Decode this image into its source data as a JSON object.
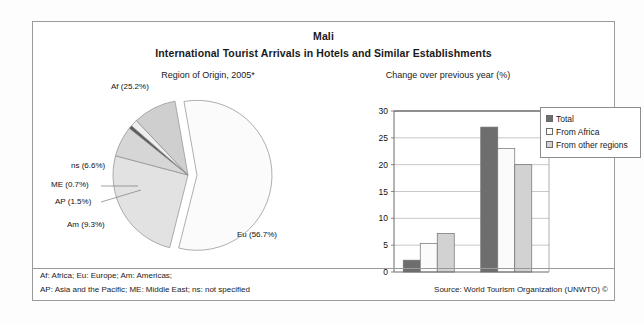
{
  "header": {
    "country": "Mali",
    "title": "International Tourist Arrivals in Hotels and Similar Establishments",
    "left_subtitle": "Region of Origin, 2005*",
    "right_subtitle": "Change over previous year (%)"
  },
  "legend": {
    "items": [
      {
        "label": "Total",
        "color": "#6e6e6e"
      },
      {
        "label": "From Africa",
        "color": "#fbfbfb"
      },
      {
        "label": "From other regions",
        "color": "#d2d2d2"
      }
    ]
  },
  "footer": {
    "note_line1": "Af: Africa; Eu: Europe; Am: Americas;",
    "note_line2": "AP: Asia and the Pacific; ME: Middle East; ns: not specified",
    "source": "Source: World Tourism Organization (UNWTO) ©"
  },
  "chart_data": [
    {
      "type": "pie",
      "title": "Region of Origin, 2005*",
      "unit": "%",
      "labels": [
        "Eu (56.7%)",
        "Af (25.2%)",
        "Am (9.3%)",
        "ns (6.6%)",
        "AP (1.5%)",
        "ME (0.7%)"
      ],
      "slices": [
        {
          "name": "Eu",
          "label": "Eu (56.7%)",
          "value": 56.7,
          "color": "#fbfbfb",
          "exploded": true
        },
        {
          "name": "Af",
          "label": "Af (25.2%)",
          "value": 25.2,
          "color": "#e2e2e2",
          "exploded": false
        },
        {
          "name": "ns",
          "label": "ns (6.6%)",
          "value": 6.6,
          "color": "#d6d6d6",
          "exploded": false
        },
        {
          "name": "ME",
          "label": "ME (0.7%)",
          "value": 0.7,
          "color": "#5a5a5a",
          "exploded": false
        },
        {
          "name": "AP",
          "label": "AP (1.5%)",
          "value": 1.5,
          "color": "#efefef",
          "exploded": false
        },
        {
          "name": "Am",
          "label": "Am (9.3%)",
          "value": 9.3,
          "color": "#cfcfcf",
          "exploded": false
        }
      ]
    },
    {
      "type": "bar",
      "title": "Change over previous year (%)",
      "xlabel": "",
      "ylabel": "",
      "ylim": [
        0,
        30
      ],
      "yticks": [
        0,
        5,
        10,
        15,
        20,
        25,
        30
      ],
      "grid": true,
      "legend_position": "right",
      "categories": [
        "2004/2003",
        "2005*/2004"
      ],
      "series": [
        {
          "name": "Total",
          "values": [
            2.2,
            27.0
          ],
          "color": "#6e6e6e"
        },
        {
          "name": "From Africa",
          "values": [
            5.3,
            23.0
          ],
          "color": "#fbfbfb"
        },
        {
          "name": "From other regions",
          "values": [
            7.2,
            20.0
          ],
          "color": "#d2d2d2"
        }
      ]
    }
  ]
}
